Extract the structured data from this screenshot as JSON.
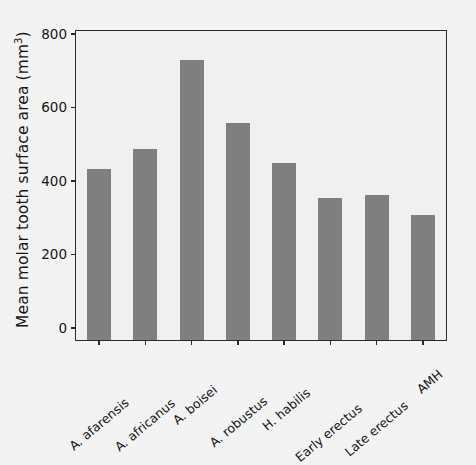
{
  "chart_data": {
    "type": "bar",
    "title": "",
    "xlabel": "",
    "ylabel": "Mean molar tooth surface area (mm3)",
    "ylabel_base": "Mean molar tooth surface area (mm",
    "ylabel_sup": "3",
    "ylabel_close": ")",
    "categories": [
      "A. afarensis",
      "A. africanus",
      "A. boisei",
      "A. robustus",
      "H. habilis",
      "Early erectus",
      "Late erectus",
      "AMH"
    ],
    "values": [
      465,
      520,
      760,
      590,
      480,
      385,
      393,
      340
    ],
    "ylim": [
      0,
      840
    ],
    "yticks": [
      0,
      200,
      400,
      600,
      800
    ],
    "ytick_labels": [
      "0",
      "200",
      "400",
      "600",
      "800"
    ],
    "grid": false,
    "legend": null,
    "series_name": "Mean molar tooth surface area",
    "bar_color": "#7f7f7f",
    "axis_color": "#2b2b2b",
    "plot_background": "#f0f0f0",
    "figure_background": "#f3f3f3",
    "text_color": "#161616",
    "xtick_label_rotation": -40
  }
}
